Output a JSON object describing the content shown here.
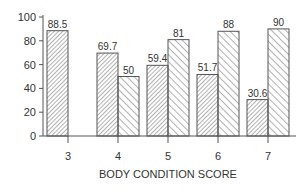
{
  "chart_data": {
    "type": "bar",
    "title": "",
    "xlabel": "BODY CONDITION SCORE",
    "ylabel": "",
    "ylim": [
      0,
      100
    ],
    "yticks": [
      0,
      20,
      40,
      60,
      80,
      100
    ],
    "categories": [
      "3",
      "4",
      "5",
      "6",
      "7"
    ],
    "series": [
      {
        "name": "Series A (forward hatch)",
        "values": [
          88.5,
          69.7,
          59.4,
          51.7,
          30.6
        ],
        "labels": [
          "88.5",
          "69.7",
          "59.4",
          "51.7",
          "30.6"
        ]
      },
      {
        "name": "Series B (back hatch)",
        "values": [
          null,
          50,
          81,
          88,
          90
        ],
        "labels": [
          "",
          "50",
          "81",
          "88",
          "90"
        ]
      }
    ],
    "grid": false,
    "legend": "none"
  },
  "colors": {
    "stroke": "#555555",
    "text": "#333333",
    "background": "#ffffff"
  }
}
